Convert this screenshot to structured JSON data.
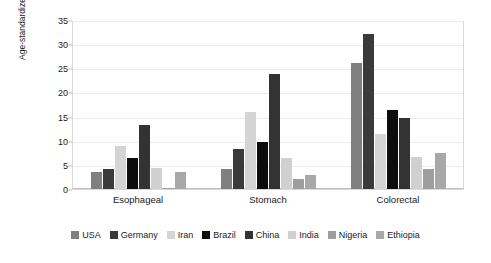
{
  "chart_data": {
    "type": "bar",
    "title": "",
    "xlabel": "",
    "ylabel": "Age-standardized incidence rates per 100,000 people",
    "ylim": [
      0,
      35
    ],
    "yticks": [
      0,
      5,
      10,
      15,
      20,
      25,
      30,
      35
    ],
    "grid": true,
    "legend_position": "bottom",
    "categories": [
      "Esophageal",
      "Stomach",
      "Colorectal"
    ],
    "series": [
      {
        "name": "USA",
        "color": "#808080",
        "values": [
          3.5,
          4.1,
          26.0
        ]
      },
      {
        "name": "Germany",
        "color": "#3a3a3a",
        "values": [
          4.2,
          8.2,
          32.1
        ]
      },
      {
        "name": "Iran",
        "color": "#d4d4d4",
        "values": [
          9.0,
          16.0,
          11.4
        ]
      },
      {
        "name": "Brazil",
        "color": "#0d0d0d",
        "values": [
          6.5,
          9.8,
          16.4
        ]
      },
      {
        "name": "China",
        "color": "#333333",
        "values": [
          13.3,
          23.8,
          14.8
        ]
      },
      {
        "name": "India",
        "color": "#d0d0d0",
        "values": [
          4.3,
          6.4,
          6.6
        ]
      },
      {
        "name": "Nigeria",
        "color": "#9e9e9e",
        "values": [
          0.3,
          2.1,
          4.2
        ]
      },
      {
        "name": "Ethiopia",
        "color": "#a8a8a8",
        "values": [
          3.6,
          3.0,
          7.5
        ]
      }
    ]
  }
}
